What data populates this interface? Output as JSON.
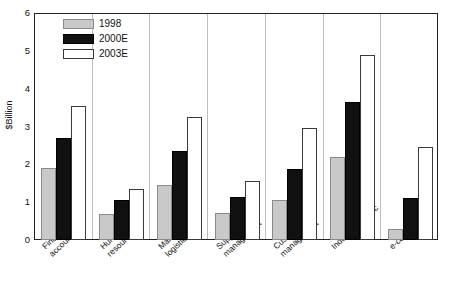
{
  "chart_data": {
    "type": "bar",
    "title": "",
    "subtitle": "",
    "xlabel": "",
    "ylabel": "$Billion",
    "ylim": [
      0,
      6
    ],
    "yticks": [
      0,
      1,
      2,
      3,
      4,
      5,
      6
    ],
    "ytick_labels": [
      "0",
      "1",
      "2",
      "3",
      "4",
      "5",
      "6"
    ],
    "grid": false,
    "legend_position": "top-left inside plot",
    "categories": [
      "Finance accounting",
      "Human resources",
      "Manufacturing logistics",
      "Supply chain management",
      "Customer management",
      "Industry-specific",
      "e-commerce"
    ],
    "category_lines": [
      [
        "Finance",
        "accounting"
      ],
      [
        "Human",
        "resources"
      ],
      [
        "Manufacturing",
        "logistics"
      ],
      [
        "Supply chain",
        "management"
      ],
      [
        "Customer",
        "management"
      ],
      [
        "Industry-specific",
        ""
      ],
      [
        "e-commerce",
        ""
      ]
    ],
    "series": [
      {
        "name": "1998",
        "color": "#c9c9c9",
        "edge_color": "#8a8a8a",
        "values": [
          1.9,
          0.7,
          1.45,
          0.72,
          1.05,
          2.2,
          0.28
        ]
      },
      {
        "name": "2000E",
        "color": "#111111",
        "edge_color": "#000000",
        "values": [
          2.7,
          1.05,
          2.35,
          1.15,
          1.88,
          3.65,
          1.1
        ]
      },
      {
        "name": "2003E",
        "color": "#ffffff",
        "edge_color": "#3a3a3a",
        "values": [
          3.55,
          1.35,
          3.25,
          1.55,
          2.95,
          4.9,
          2.45
        ]
      }
    ]
  },
  "legend": {
    "items": [
      {
        "label": "1998"
      },
      {
        "label": "2000E"
      },
      {
        "label": "2003E"
      }
    ]
  },
  "axis": {
    "y_title": "$Billion"
  }
}
